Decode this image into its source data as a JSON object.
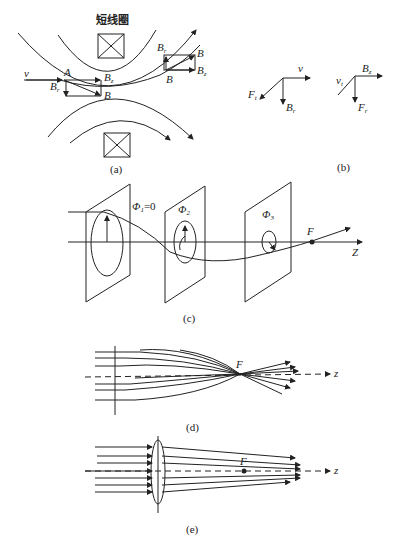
{
  "figure": {
    "panel_a": {
      "title": "短线圈",
      "caption": "(a)",
      "labels": {
        "v": "v",
        "A": "A",
        "Bz_left": "B",
        "Bz_left_sub": "z",
        "Br_left": "B",
        "Br_left_sub": "r",
        "B_left": "B",
        "Br_right": "B",
        "Br_right_sub": "r",
        "B_right_top": "B",
        "Bz_right": "B",
        "Bz_right_sub": "z",
        "B_right_bottom": "B"
      }
    },
    "panel_b": {
      "caption": "(b)",
      "labels": {
        "Ft": "F",
        "Ft_sub": "t",
        "v": "v",
        "Br": "B",
        "Br_sub": "r",
        "vt": "v",
        "vt_sub": "t",
        "Bz": "B",
        "Bz_sub": "z",
        "Fr": "F",
        "Fr_sub": "r"
      }
    },
    "panel_c": {
      "caption": "(c)",
      "labels": {
        "phi1": "Φ",
        "phi1_sub": "1",
        "phi1_eq": "=0",
        "phi2": "Φ",
        "phi2_sub": "2",
        "phi3": "Φ",
        "phi3_sub": "3",
        "F": "F",
        "Z": "Z"
      }
    },
    "panel_d": {
      "caption": "(d)",
      "labels": {
        "F": "F",
        "z": "z"
      }
    },
    "panel_e": {
      "caption": "(e)",
      "labels": {
        "F": "F",
        "z": "z"
      }
    }
  }
}
